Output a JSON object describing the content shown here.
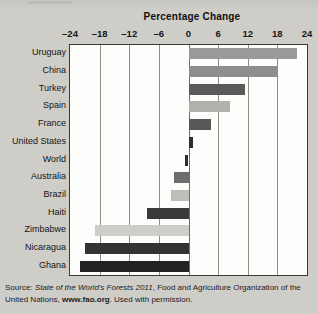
{
  "chart_title": "Percentage Change",
  "chart_data": {
    "type": "bar",
    "orientation": "horizontal",
    "title": "Percentage Change",
    "xlabel": "Percentage Change",
    "ylabel": "",
    "xlim": [
      -24,
      24
    ],
    "xticks": [
      -24,
      -18,
      -12,
      -6,
      0,
      6,
      12,
      18,
      24
    ],
    "xtick_labels": [
      "–24",
      "–18",
      "–12",
      "–6",
      "0",
      "6",
      "12",
      "18",
      "24"
    ],
    "grid": true,
    "legend": "none",
    "categories": [
      "Uruguay",
      "China",
      "Turkey",
      "Spain",
      "France",
      "United States",
      "World",
      "Australia",
      "Brazil",
      "Haiti",
      "Zimbabwe",
      "Nicaragua",
      "Ghana"
    ],
    "values": [
      22,
      18,
      11.5,
      8.5,
      4.5,
      1,
      -0.8,
      -3,
      -3.5,
      -8.5,
      -19,
      -21,
      -22
    ],
    "bar_colors": [
      "#9a9a98",
      "#8e8e8c",
      "#5a5a58",
      "#b0b0ad",
      "#585856",
      "#2e2e2c",
      "#2e2e2c",
      "#6e6e6c",
      "#bdbdba",
      "#3a3a38",
      "#cdcdc9",
      "#333331",
      "#232321"
    ]
  },
  "source": {
    "prefix": "Source: ",
    "title_italic": "State of the World's Forests 2011",
    "middle": ", Food and Agriculture Organization of the United Nations, ",
    "url": "www.fao.org",
    "suffix": ". Used with permission."
  }
}
